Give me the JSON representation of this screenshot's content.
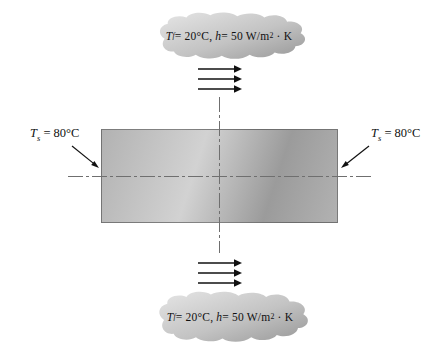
{
  "figure_name": "plate-convection-diagram",
  "fluid_top": {
    "T": "T",
    "T_sub": "f",
    "eq1": " = 20°C,  ",
    "h": "h",
    "eq2": " = 50 W/m",
    "exp": "2",
    "tail": " · K"
  },
  "fluid_bottom": {
    "T": "T",
    "T_sub": "f",
    "eq1": " = 20°C,  ",
    "h": "h",
    "eq2": " = 50 W/m",
    "exp": "2",
    "tail": " · K"
  },
  "surface_left": {
    "T": "T",
    "T_sub": "s",
    "eq": " = 80°C"
  },
  "surface_right": {
    "T": "T",
    "T_sub": "s",
    "eq": " = 80°C"
  },
  "colors": {
    "background": "#ffffff",
    "plate_light": "#d2d2d2",
    "plate_mid": "#b2b2b2",
    "plate_dark": "#9b9b9b",
    "cloud_light": "#e5e5e5",
    "cloud_mid": "#c3c3c3",
    "cloud_dark": "#979797",
    "centerline": "#6f6f6f",
    "arrow": "#111111",
    "text": "#111111"
  }
}
